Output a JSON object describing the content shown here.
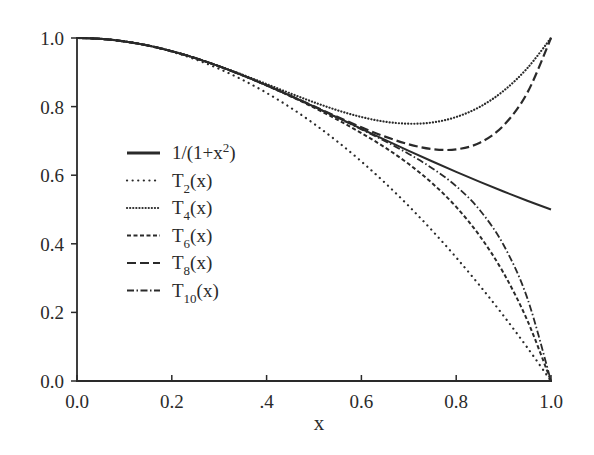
{
  "chart_data": {
    "type": "line",
    "title": "",
    "xlabel": "x",
    "ylabel": "",
    "xlim": [
      0.0,
      1.0
    ],
    "ylim": [
      0.0,
      1.0
    ],
    "grid": false,
    "legend_position": "center-left",
    "x_ticks": [
      "0.0",
      "0.2",
      ".4",
      "0.6",
      "0.8",
      "1.0"
    ],
    "y_ticks": [
      "0.0",
      "0.2",
      "0.4",
      "0.6",
      "0.8",
      "1.0"
    ],
    "x": [
      0.0,
      0.05,
      0.1,
      0.15,
      0.2,
      0.25,
      0.3,
      0.35,
      0.4,
      0.45,
      0.5,
      0.55,
      0.6,
      0.65,
      0.7,
      0.75,
      0.8,
      0.85,
      0.9,
      0.95,
      1.0
    ],
    "series": [
      {
        "name": "1/(1+x2)",
        "label_main": "1/(1+x",
        "label_sup": "2",
        "label_tail": ")",
        "style": "solid",
        "width": 2.0,
        "values": [
          1.0,
          0.9975,
          0.9901,
          0.978,
          0.9615,
          0.9412,
          0.9174,
          0.8909,
          0.8621,
          0.8316,
          0.8,
          0.7678,
          0.7353,
          0.703,
          0.6711,
          0.64,
          0.6098,
          0.5806,
          0.5525,
          0.5256,
          0.5
        ]
      },
      {
        "name": "T2(x)",
        "label_main": "T",
        "label_sub": "2",
        "label_tail": "(x)",
        "style": "dot",
        "width": 2.2,
        "values": [
          1.0,
          0.9975,
          0.99,
          0.9775,
          0.96,
          0.9375,
          0.91,
          0.8775,
          0.84,
          0.7975,
          0.75,
          0.6975,
          0.64,
          0.5775,
          0.51,
          0.4375,
          0.36,
          0.2775,
          0.19,
          0.0975,
          0.0
        ]
      },
      {
        "name": "T4(x)",
        "label_main": "T",
        "label_sub": "4",
        "label_tail": "(x)",
        "style": "fine-dot",
        "width": 2.2,
        "values": [
          1.0,
          0.9975,
          0.9901,
          0.978,
          0.9616,
          0.9414,
          0.9181,
          0.8925,
          0.8656,
          0.8385,
          0.8125,
          0.789,
          0.7696,
          0.756,
          0.7501,
          0.7539,
          0.7696,
          0.7995,
          0.8461,
          0.912,
          1.0
        ]
      },
      {
        "name": "T6(x)",
        "label_main": "T",
        "label_sub": "6",
        "label_tail": "(x)",
        "style": "short-dash",
        "width": 2.0,
        "values": [
          1.0,
          0.9975,
          0.9901,
          0.978,
          0.9615,
          0.9412,
          0.9174,
          0.8907,
          0.8615,
          0.8302,
          0.7969,
          0.7613,
          0.7229,
          0.6806,
          0.6325,
          0.5759,
          0.5075,
          0.4223,
          0.3147,
          0.1769,
          0.0
        ]
      },
      {
        "name": "T8(x)",
        "label_main": "T",
        "label_sub": "8",
        "label_tail": "(x)",
        "style": "long-dash",
        "width": 2.2,
        "values": [
          1.0,
          0.9975,
          0.9901,
          0.978,
          0.9615,
          0.9412,
          0.9174,
          0.8909,
          0.8622,
          0.8319,
          0.8008,
          0.7697,
          0.7397,
          0.7125,
          0.6901,
          0.676,
          0.6752,
          0.6948,
          0.7451,
          0.8403,
          1.0
        ]
      },
      {
        "name": "T10(x)",
        "label_main": "T",
        "label_sub": "10",
        "label_tail": "(x)",
        "style": "dash-dot",
        "width": 1.8,
        "values": [
          1.0,
          0.9975,
          0.9901,
          0.978,
          0.9615,
          0.9412,
          0.9174,
          0.8909,
          0.8621,
          0.8316,
          0.7998,
          0.7672,
          0.7337,
          0.699,
          0.6619,
          0.6197,
          0.5679,
          0.4979,
          0.3964,
          0.2416,
          0.0
        ]
      }
    ]
  },
  "axes": {
    "x_title": "x"
  }
}
